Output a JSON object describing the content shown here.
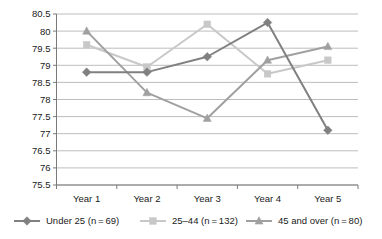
{
  "chart_data": {
    "type": "line",
    "title": "",
    "xlabel": "",
    "ylabel": "",
    "categories": [
      "Year 1",
      "Year 2",
      "Year 3",
      "Year 4",
      "Year 5"
    ],
    "ylim": [
      75.5,
      80.5
    ],
    "ytick_step": 0.5,
    "yticks": [
      "80.5",
      "80",
      "79.5",
      "79",
      "78.5",
      "78",
      "77.5",
      "77",
      "76.5",
      "76",
      "75.5"
    ],
    "ytick_values": [
      80.5,
      80,
      79.5,
      79,
      78.5,
      78,
      77.5,
      77,
      76.5,
      76,
      75.5
    ],
    "grid": "horizontal",
    "legend_position": "bottom",
    "series": [
      {
        "name": "Under 25 (n = 69)",
        "marker": "diamond",
        "color": "#808080",
        "values": [
          78.8,
          78.8,
          79.25,
          80.25,
          77.1
        ]
      },
      {
        "name": "25–44 (n = 132)",
        "marker": "square",
        "color": "#c8c8c8",
        "values": [
          79.6,
          78.95,
          80.2,
          78.75,
          79.15
        ]
      },
      {
        "name": "45 and over (n = 80)",
        "marker": "triangle",
        "color": "#a0a0a0",
        "values": [
          80.0,
          78.2,
          77.45,
          79.15,
          79.55
        ]
      }
    ]
  },
  "axes": {
    "y_tick_labels": [
      "80.5",
      "80",
      "79.5",
      "79",
      "78.5",
      "78",
      "77.5",
      "77",
      "76.5",
      "76",
      "75.5"
    ],
    "x_tick_labels": [
      "Year 1",
      "Year 2",
      "Year 3",
      "Year 4",
      "Year 5"
    ]
  },
  "legend": {
    "entries": [
      {
        "label": "Under 25 (n = 69)",
        "marker": "diamond",
        "color": "#808080"
      },
      {
        "label": "25–44 (n = 132)",
        "marker": "square",
        "color": "#c8c8c8"
      },
      {
        "label": "45 and over (n = 80)",
        "marker": "triangle",
        "color": "#a0a0a0"
      }
    ]
  },
  "colors": {
    "grid": "#b5b5b5",
    "axis": "#7a7a7a",
    "text": "#1a1a1a",
    "background": "#ffffff",
    "series_under25": "#808080",
    "series_25_44": "#c8c8c8",
    "series_45_over": "#a0a0a0"
  }
}
